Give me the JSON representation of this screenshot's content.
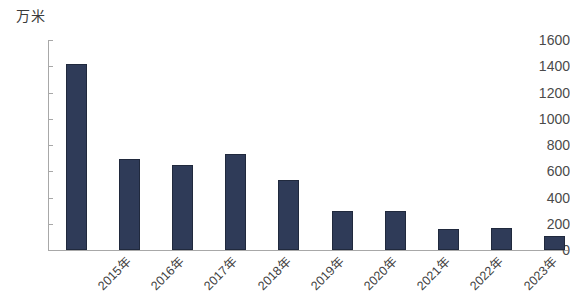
{
  "chart_data": {
    "type": "bar",
    "title": "",
    "subtitle": "",
    "unit_label": "万米",
    "xlabel": "",
    "ylabel": "",
    "categories": [
      "2015年",
      "2016年",
      "2017年",
      "2018年",
      "2019年",
      "2020年",
      "2021年",
      "2022年",
      "2023年",
      "2024年"
    ],
    "values": [
      1420,
      690,
      650,
      730,
      530,
      300,
      300,
      160,
      170,
      110
    ],
    "series": [
      {
        "name": "",
        "values": [
          1420,
          690,
          650,
          730,
          530,
          300,
          300,
          160,
          170,
          110
        ]
      }
    ],
    "ylim": [
      0,
      1600
    ],
    "ytick_labels": [
      "1600",
      "1400",
      "1200",
      "1000",
      "800",
      "600",
      "400",
      "200",
      "0"
    ],
    "ytick_values": [
      1600,
      1400,
      1200,
      1000,
      800,
      600,
      400,
      200,
      0
    ],
    "ytick_step": 200,
    "grid": false,
    "legend": false,
    "legend_position": "none",
    "bar_color": "#2f3b58",
    "axis_color": "#a8a8a8",
    "text_color": "#3f3f3f",
    "xtick_rotation": -45
  }
}
